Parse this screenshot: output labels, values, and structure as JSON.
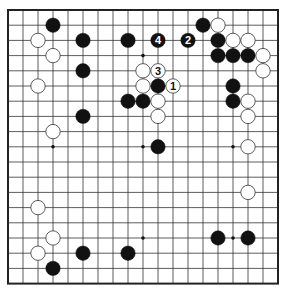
{
  "board": {
    "size": 19,
    "origin_x": 8,
    "origin_y": 10,
    "spacing_x": 15,
    "spacing_y": 15.2,
    "line_color": "#333333",
    "border_color": "#222222",
    "star_points": [
      [
        3,
        3
      ],
      [
        3,
        9
      ],
      [
        3,
        15
      ],
      [
        9,
        3
      ],
      [
        9,
        9
      ],
      [
        9,
        15
      ],
      [
        15,
        3
      ],
      [
        15,
        9
      ],
      [
        15,
        15
      ]
    ]
  },
  "colors": {
    "black_stone": "#111111",
    "white_stone": "#ffffff",
    "white_stroke": "#333333",
    "label_on_black": "#ffffff",
    "label_on_white": "#111111"
  },
  "stones": [
    {
      "col": 3,
      "row": 1,
      "color": "black"
    },
    {
      "col": 5,
      "row": 2,
      "color": "black"
    },
    {
      "col": 5,
      "row": 4,
      "color": "black"
    },
    {
      "col": 5,
      "row": 7,
      "color": "black"
    },
    {
      "col": 8,
      "row": 2,
      "color": "black"
    },
    {
      "col": 10,
      "row": 2,
      "color": "black",
      "label": "4"
    },
    {
      "col": 12,
      "row": 2,
      "color": "black",
      "label": "2"
    },
    {
      "col": 13,
      "row": 1,
      "color": "black"
    },
    {
      "col": 14,
      "row": 2,
      "color": "black"
    },
    {
      "col": 14,
      "row": 3,
      "color": "black"
    },
    {
      "col": 15,
      "row": 3,
      "color": "black"
    },
    {
      "col": 16,
      "row": 3,
      "color": "black"
    },
    {
      "col": 10,
      "row": 5,
      "color": "black"
    },
    {
      "col": 8,
      "row": 6,
      "color": "black"
    },
    {
      "col": 9,
      "row": 6,
      "color": "black"
    },
    {
      "col": 15,
      "row": 5,
      "color": "black"
    },
    {
      "col": 15,
      "row": 6,
      "color": "black"
    },
    {
      "col": 10,
      "row": 9,
      "color": "black"
    },
    {
      "col": 3,
      "row": 17,
      "color": "black"
    },
    {
      "col": 5,
      "row": 16,
      "color": "black"
    },
    {
      "col": 8,
      "row": 16,
      "color": "black"
    },
    {
      "col": 14,
      "row": 15,
      "color": "black"
    },
    {
      "col": 16,
      "row": 15,
      "color": "black"
    },
    {
      "col": 2,
      "row": 2,
      "color": "white"
    },
    {
      "col": 3,
      "row": 3,
      "color": "white"
    },
    {
      "col": 2,
      "row": 5,
      "color": "white"
    },
    {
      "col": 3,
      "row": 8,
      "color": "white"
    },
    {
      "col": 9,
      "row": 4,
      "color": "white"
    },
    {
      "col": 10,
      "row": 4,
      "color": "white",
      "label": "3"
    },
    {
      "col": 9,
      "row": 5,
      "color": "white"
    },
    {
      "col": 11,
      "row": 5,
      "color": "white",
      "label": "1"
    },
    {
      "col": 10,
      "row": 6,
      "color": "white"
    },
    {
      "col": 10,
      "row": 7,
      "color": "white"
    },
    {
      "col": 14,
      "row": 1,
      "color": "white"
    },
    {
      "col": 15,
      "row": 2,
      "color": "white"
    },
    {
      "col": 16,
      "row": 2,
      "color": "white"
    },
    {
      "col": 17,
      "row": 3,
      "color": "white"
    },
    {
      "col": 17,
      "row": 4,
      "color": "white"
    },
    {
      "col": 16,
      "row": 6,
      "color": "white"
    },
    {
      "col": 16,
      "row": 7,
      "color": "white"
    },
    {
      "col": 16,
      "row": 9,
      "color": "white"
    },
    {
      "col": 16,
      "row": 12,
      "color": "white"
    },
    {
      "col": 2,
      "row": 13,
      "color": "white"
    },
    {
      "col": 3,
      "row": 15,
      "color": "white"
    },
    {
      "col": 2,
      "row": 16,
      "color": "white"
    }
  ]
}
